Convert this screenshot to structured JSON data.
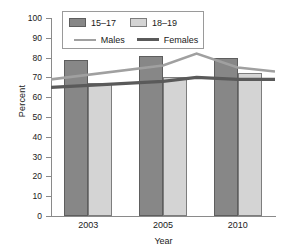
{
  "chart_data": {
    "type": "bar",
    "title": "",
    "xlabel": "Year",
    "ylabel": "Percent",
    "categories": [
      "2003",
      "2005",
      "2010"
    ],
    "ylim": [
      0,
      100
    ],
    "yticks": [
      0,
      10,
      20,
      30,
      40,
      50,
      60,
      70,
      80,
      90,
      100
    ],
    "grid": false,
    "legend_position": "top-center",
    "series": [
      {
        "name": "15–17",
        "kind": "bar",
        "color": "#878787",
        "values": [
          79,
          81,
          80
        ]
      },
      {
        "name": "18–19",
        "kind": "bar",
        "color": "#d4d4d4",
        "values": [
          67,
          70,
          72
        ]
      },
      {
        "name": "Males",
        "kind": "line",
        "color": "#a0a0a0",
        "values": [
          69,
          76,
          82,
          75,
          73
        ],
        "x": [
          0,
          1,
          1.45,
          2,
          2.5
        ]
      },
      {
        "name": "Females",
        "kind": "line",
        "color": "#5a5a5a",
        "values": [
          65,
          68,
          70,
          69,
          69
        ],
        "x": [
          0,
          1,
          1.45,
          2,
          2.5
        ]
      }
    ]
  },
  "axes": {
    "y_label": "Percent",
    "x_label": "Year",
    "y_tick_labels": [
      "100",
      "90",
      "80",
      "70",
      "60",
      "50",
      "40",
      "30",
      "20",
      "10",
      "0"
    ],
    "x_tick_labels": [
      "2003",
      "2005",
      "2010"
    ]
  },
  "legend": {
    "bar_items": [
      {
        "label": "15–17",
        "swatch": "dark-gray-swatch"
      },
      {
        "label": "18–19",
        "swatch": "light-gray-swatch"
      }
    ],
    "line_items": [
      {
        "label": "Males",
        "swatch": "light-gray-line"
      },
      {
        "label": "Females",
        "swatch": "dark-gray-line"
      }
    ]
  },
  "colors": {
    "series_15_17": "#878787",
    "series_18_19": "#d4d4d4",
    "males_line": "#a0a0a0",
    "females_line": "#5a5a5a",
    "axis": "#8a8a8a",
    "background": "#ffffff"
  }
}
